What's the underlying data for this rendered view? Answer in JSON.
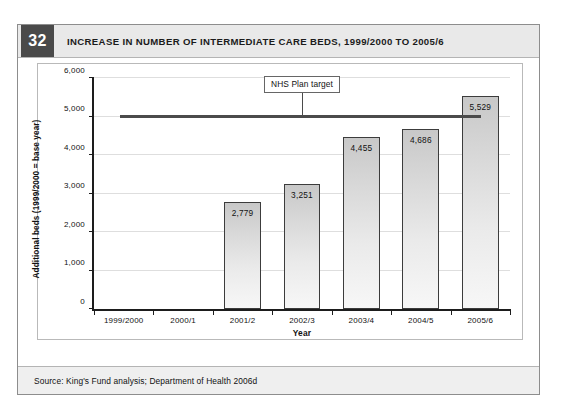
{
  "figure": {
    "number": "32",
    "title": "INCREASE IN NUMBER OF INTERMEDIATE CARE BEDS, 1999/2000 TO 2005/6",
    "source": "Source: King's Fund analysis; Department of Health 2006d"
  },
  "colors": {
    "header_background": "#e9e9e9",
    "number_badge": "#4a4a4a",
    "bar_fill_top": "#c8c8c8",
    "bar_fill_bottom": "#f7f7f7",
    "bar_outline": "#3c3c3c",
    "target_line": "#4b4b4b",
    "axis": "#1d1d1d",
    "gridline": "#dedede",
    "source_background": "#efefef"
  },
  "chart_data": {
    "type": "bar",
    "title": "INCREASE IN NUMBER OF INTERMEDIATE CARE BEDS, 1999/2000 TO 2005/6",
    "xlabel": "Year",
    "ylabel": "Additional beds (1999/2000 = base year)",
    "categories": [
      "1999/2000",
      "2000/1",
      "2001/2",
      "2002/3",
      "2003/4",
      "2004/5",
      "2005/6"
    ],
    "values": [
      null,
      null,
      2779,
      3251,
      4455,
      4686,
      5529
    ],
    "value_labels": [
      "",
      "",
      "2,779",
      "3,251",
      "4,455",
      "4,686",
      "5,529"
    ],
    "ylim": [
      0,
      6000
    ],
    "ytick_values": [
      0,
      1000,
      2000,
      3000,
      4000,
      5000,
      6000
    ],
    "ytick_labels": [
      "0",
      "1,000",
      "2,000",
      "3,000",
      "4,000",
      "5,000",
      "6,000"
    ],
    "grid": true,
    "legend": "none",
    "annotations": [
      {
        "name": "nhs-plan-target",
        "label": "NHS Plan target",
        "type": "horizontal-line",
        "value": 5000,
        "start_category_index": 0,
        "end_category_index": 6,
        "label_category_index": 3
      }
    ]
  }
}
